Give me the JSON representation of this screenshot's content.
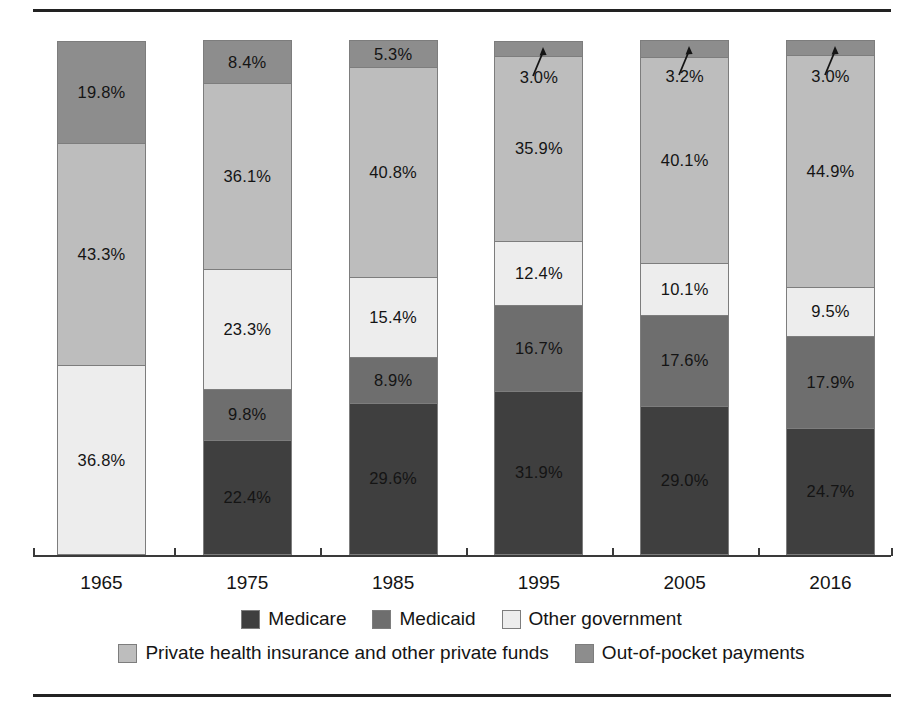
{
  "chart_data": {
    "type": "bar",
    "subtype": "stacked-percent",
    "title": "",
    "subtitle": "",
    "xlabel": "",
    "ylabel": "",
    "ylim": [
      0,
      100
    ],
    "grid": false,
    "legend_position": "bottom",
    "categories": [
      "1965",
      "1975",
      "1985",
      "1995",
      "2005",
      "2016"
    ],
    "series": [
      {
        "name": "Medicare",
        "color": "#3f3f3f",
        "values": [
          0.0,
          22.4,
          29.6,
          31.9,
          29.0,
          24.7
        ],
        "labels": [
          "",
          "22.4%",
          "29.6%",
          "31.9%",
          "29.0%",
          "24.7%"
        ]
      },
      {
        "name": "Medicaid",
        "color": "#6e6e6e",
        "values": [
          0.0,
          9.8,
          8.9,
          16.7,
          17.6,
          17.9
        ],
        "labels": [
          "",
          "9.8%",
          "8.9%",
          "16.7%",
          "17.6%",
          "17.9%"
        ]
      },
      {
        "name": "Other government",
        "color": "#ededed",
        "values": [
          36.8,
          23.3,
          15.4,
          12.4,
          10.1,
          9.5
        ],
        "labels": [
          "36.8%",
          "23.3%",
          "15.4%",
          "12.4%",
          "10.1%",
          "9.5%"
        ]
      },
      {
        "name": "Private health insurance and other private funds",
        "color": "#bdbdbd",
        "values": [
          43.3,
          36.1,
          40.8,
          35.9,
          40.1,
          44.9
        ],
        "labels": [
          "43.3%",
          "36.1%",
          "40.8%",
          "35.9%",
          "40.1%",
          "44.9%"
        ]
      },
      {
        "name": "Out-of-pocket payments",
        "color": "#8d8d8d",
        "values": [
          19.8,
          8.4,
          5.3,
          3.0,
          3.2,
          3.0
        ],
        "labels": [
          "19.8%",
          "8.4%",
          "5.3%",
          "3.0%",
          "3.2%",
          "3.0%"
        ],
        "callout": [
          false,
          false,
          false,
          true,
          true,
          true
        ]
      }
    ]
  },
  "legend": {
    "row1": [
      {
        "label": "Medicare",
        "color": "#3f3f3f"
      },
      {
        "label": "Medicaid",
        "color": "#6e6e6e"
      },
      {
        "label": "Other government",
        "color": "#ededed"
      }
    ],
    "row2": [
      {
        "label": "Private health insurance and other private funds",
        "color": "#bdbdbd"
      },
      {
        "label": "Out-of-pocket payments",
        "color": "#8d8d8d"
      }
    ]
  },
  "axis": {
    "years": [
      "1965",
      "1975",
      "1985",
      "1995",
      "2005",
      "2016"
    ]
  },
  "colors": {
    "medicare": "#3f3f3f",
    "medicaid": "#6e6e6e",
    "other_government": "#ededed",
    "private_insurance": "#bdbdbd",
    "out_of_pocket": "#8d8d8d",
    "rule": "#222222",
    "segment_border": "#7d7d7d",
    "text": "#141414"
  }
}
